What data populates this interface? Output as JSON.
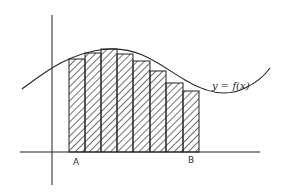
{
  "diagram": {
    "type": "riemann-sum",
    "curve_label": "y = f(x)",
    "lower_bound_label": "A",
    "upper_bound_label": "B",
    "num_rectangles": 8,
    "rectangle_style": "diagonal hatching",
    "rectangle_heights_description": "inscribed rectangles (lower sum) under curve",
    "colors": {
      "stroke": "#222222",
      "background": "#ffffff"
    }
  }
}
